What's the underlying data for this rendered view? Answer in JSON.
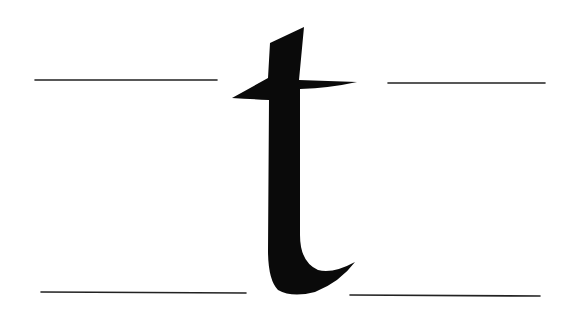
{
  "figure": {
    "letter": "t",
    "ink_color": "#0a0a0a",
    "line_color": "#222222",
    "background": "#ffffff",
    "guide_lines": [
      {
        "name": "top-left",
        "x1": 35,
        "y1": 80,
        "x2": 217,
        "y2": 80
      },
      {
        "name": "top-right",
        "x1": 388,
        "y1": 83,
        "x2": 545,
        "y2": 83
      },
      {
        "name": "bottom-left",
        "x1": 41,
        "y1": 292,
        "x2": 246,
        "y2": 293
      },
      {
        "name": "bottom-right",
        "x1": 350,
        "y1": 295,
        "x2": 540,
        "y2": 296
      }
    ]
  }
}
